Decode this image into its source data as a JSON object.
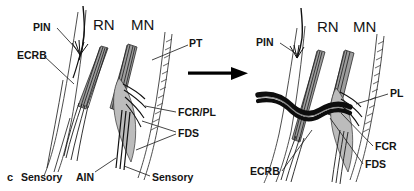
{
  "figure": {
    "panel_letter": "c",
    "caption_visible": false,
    "background_color": "#ffffff",
    "ink_color": "#141414",
    "muscle_shade": "#9d9d9d",
    "panel_count": 2,
    "transition_arrow": {
      "icon": "right-arrow-icon",
      "direction": "right",
      "color": "#000000"
    }
  },
  "left_panel": {
    "name": "pre-transposition",
    "labels": [
      {
        "id": "pin",
        "text": "PIN",
        "x": 33,
        "y": 31,
        "anchor": "start"
      },
      {
        "id": "rn",
        "text": "RN",
        "x": 93,
        "y": 30,
        "anchor": "start"
      },
      {
        "id": "mn",
        "text": "MN",
        "x": 131,
        "y": 30,
        "anchor": "start"
      },
      {
        "id": "ecrb",
        "text": "ECRB",
        "x": 17,
        "y": 59,
        "anchor": "start"
      },
      {
        "id": "pt",
        "text": "PT",
        "x": 189,
        "y": 47,
        "anchor": "start"
      },
      {
        "id": "fcr-pl",
        "text": "FCR/PL",
        "x": 178,
        "y": 116,
        "anchor": "start"
      },
      {
        "id": "fds",
        "text": "FDS",
        "x": 178,
        "y": 137,
        "anchor": "start"
      },
      {
        "id": "sensory-1",
        "text": "Sensory",
        "x": 21,
        "y": 181,
        "anchor": "start"
      },
      {
        "id": "ain",
        "text": "AIN",
        "x": 76,
        "y": 181,
        "anchor": "start"
      },
      {
        "id": "sensory-2",
        "text": "Sensory",
        "x": 152,
        "y": 181,
        "anchor": "start"
      }
    ]
  },
  "right_panel": {
    "name": "post-transposition",
    "labels": [
      {
        "id": "pin-r",
        "text": "PIN",
        "x": 256,
        "y": 46,
        "anchor": "start"
      },
      {
        "id": "rn-r",
        "text": "RN",
        "x": 317,
        "y": 32,
        "anchor": "start"
      },
      {
        "id": "mn-r",
        "text": "MN",
        "x": 353,
        "y": 32,
        "anchor": "start"
      },
      {
        "id": "pl-r",
        "text": "PL",
        "x": 390,
        "y": 97,
        "anchor": "start"
      },
      {
        "id": "fcr-r",
        "text": "FCR",
        "x": 375,
        "y": 150,
        "anchor": "start"
      },
      {
        "id": "fds-r",
        "text": "FDS",
        "x": 365,
        "y": 168,
        "anchor": "start"
      },
      {
        "id": "ecrb-r",
        "text": "ECRB",
        "x": 250,
        "y": 175,
        "anchor": "start"
      }
    ]
  },
  "legend": {
    "abbreviations": [
      {
        "abbr": "PIN",
        "meaning": "posterior interosseous nerve"
      },
      {
        "abbr": "RN",
        "meaning": "radial nerve"
      },
      {
        "abbr": "MN",
        "meaning": "median nerve"
      },
      {
        "abbr": "ECRB",
        "meaning": "extensor carpi radialis brevis"
      },
      {
        "abbr": "PT",
        "meaning": "pronator teres"
      },
      {
        "abbr": "FCR/PL",
        "meaning": "flexor carpi radialis / palmaris longus"
      },
      {
        "abbr": "FDS",
        "meaning": "flexor digitorum superficialis"
      },
      {
        "abbr": "AIN",
        "meaning": "anterior interosseous nerve"
      }
    ]
  }
}
